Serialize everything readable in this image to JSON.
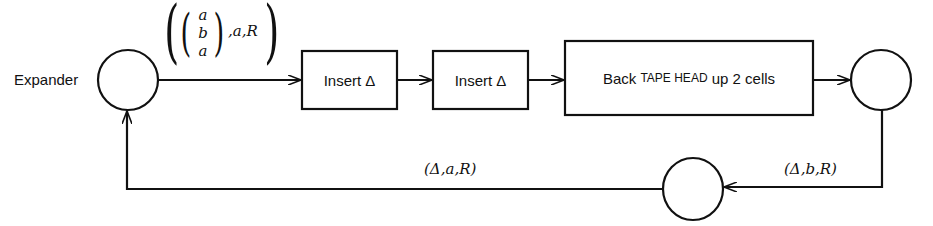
{
  "diagram": {
    "start_label": "Expander",
    "top_edge_label": {
      "vector": [
        "a",
        "b",
        "a"
      ],
      "tail": ",a,R"
    },
    "boxes": [
      {
        "id": "insert-1",
        "label": "Insert Δ"
      },
      {
        "id": "insert-2",
        "label": "Insert Δ"
      },
      {
        "id": "back-tape-head",
        "label_parts": [
          "Back ",
          "Tape Head",
          " up 2 cells"
        ]
      }
    ],
    "bottom_edges": [
      {
        "label": "(Δ,a,R)"
      },
      {
        "label": "(Δ,b,R)"
      }
    ],
    "colors": {
      "stroke": "#111111",
      "background": "#ffffff"
    }
  }
}
